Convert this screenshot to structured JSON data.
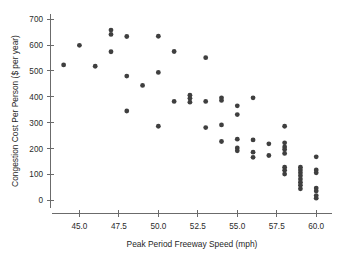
{
  "chart_data": {
    "type": "scatter",
    "title": "",
    "xlabel": "Peak Period Freeway Speed (mph)",
    "ylabel": "Congestion Cost Per Person ($ per year)",
    "xlim": [
      43.2,
      61.0
    ],
    "ylim": [
      -30,
      720
    ],
    "grid": false,
    "legend": null,
    "marker_color": "#3f3f3f",
    "axis_color": "#6b6b6b",
    "xticks": [
      45.0,
      47.5,
      50.0,
      52.5,
      55.0,
      57.5,
      60.0
    ],
    "xtick_labels": [
      "45.0",
      "47.5",
      "50.0",
      "52.5",
      "55.0",
      "57.5",
      "60.0"
    ],
    "yticks": [
      0,
      100,
      200,
      300,
      400,
      500,
      600,
      700
    ],
    "ytick_labels": [
      "0",
      "100",
      "200",
      "300",
      "400",
      "500",
      "600",
      "700"
    ],
    "points": [
      {
        "x": 44.0,
        "y": 523
      },
      {
        "x": 45.0,
        "y": 599
      },
      {
        "x": 46.0,
        "y": 518
      },
      {
        "x": 47.0,
        "y": 658
      },
      {
        "x": 47.0,
        "y": 641
      },
      {
        "x": 47.0,
        "y": 574
      },
      {
        "x": 48.0,
        "y": 633
      },
      {
        "x": 48.0,
        "y": 480
      },
      {
        "x": 48.0,
        "y": 345
      },
      {
        "x": 49.0,
        "y": 444
      },
      {
        "x": 50.0,
        "y": 634
      },
      {
        "x": 50.0,
        "y": 494
      },
      {
        "x": 50.0,
        "y": 286
      },
      {
        "x": 51.0,
        "y": 575
      },
      {
        "x": 51.0,
        "y": 382
      },
      {
        "x": 52.0,
        "y": 406
      },
      {
        "x": 52.0,
        "y": 394
      },
      {
        "x": 52.0,
        "y": 379
      },
      {
        "x": 53.0,
        "y": 551
      },
      {
        "x": 53.0,
        "y": 382
      },
      {
        "x": 53.0,
        "y": 281
      },
      {
        "x": 54.0,
        "y": 396
      },
      {
        "x": 54.0,
        "y": 386
      },
      {
        "x": 54.0,
        "y": 291
      },
      {
        "x": 54.0,
        "y": 227
      },
      {
        "x": 55.0,
        "y": 365
      },
      {
        "x": 55.0,
        "y": 331
      },
      {
        "x": 55.0,
        "y": 236
      },
      {
        "x": 55.0,
        "y": 202
      },
      {
        "x": 55.0,
        "y": 191
      },
      {
        "x": 56.0,
        "y": 396
      },
      {
        "x": 56.0,
        "y": 233
      },
      {
        "x": 56.0,
        "y": 186
      },
      {
        "x": 56.0,
        "y": 166
      },
      {
        "x": 57.0,
        "y": 218
      },
      {
        "x": 57.0,
        "y": 173
      },
      {
        "x": 58.0,
        "y": 286
      },
      {
        "x": 58.0,
        "y": 222
      },
      {
        "x": 58.0,
        "y": 206
      },
      {
        "x": 58.0,
        "y": 196
      },
      {
        "x": 58.0,
        "y": 181
      },
      {
        "x": 58.0,
        "y": 128
      },
      {
        "x": 58.0,
        "y": 116
      },
      {
        "x": 58.0,
        "y": 101
      },
      {
        "x": 59.0,
        "y": 128
      },
      {
        "x": 59.0,
        "y": 117
      },
      {
        "x": 59.0,
        "y": 106
      },
      {
        "x": 59.0,
        "y": 95
      },
      {
        "x": 59.0,
        "y": 82
      },
      {
        "x": 59.0,
        "y": 70
      },
      {
        "x": 59.0,
        "y": 58
      },
      {
        "x": 59.0,
        "y": 44
      },
      {
        "x": 60.0,
        "y": 168
      },
      {
        "x": 60.0,
        "y": 117
      },
      {
        "x": 60.0,
        "y": 106
      },
      {
        "x": 60.0,
        "y": 47
      },
      {
        "x": 60.0,
        "y": 36
      },
      {
        "x": 60.0,
        "y": 18
      },
      {
        "x": 60.0,
        "y": 8
      }
    ]
  }
}
